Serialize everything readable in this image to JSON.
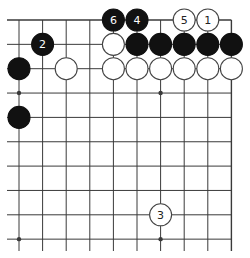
{
  "diagram": {
    "type": "go-board-fragment",
    "columns": 10,
    "rows": 10,
    "edges": [
      "top",
      "right"
    ],
    "grid_origin": {
      "x": 19,
      "y": 20
    },
    "spacing": {
      "x": 23.6,
      "y": 24.35
    },
    "stone_radius": 11,
    "line_color": "#3a3a3a",
    "black_color": "#111111",
    "white_fill": "#ffffff",
    "star_points": [
      [
        0,
        3
      ],
      [
        6,
        3
      ],
      [
        0,
        9
      ],
      [
        6,
        9
      ]
    ],
    "stones": [
      {
        "col": 4,
        "row": 0,
        "color": "black",
        "label": "6"
      },
      {
        "col": 5,
        "row": 0,
        "color": "black",
        "label": "4"
      },
      {
        "col": 7,
        "row": 0,
        "color": "white",
        "label": "5"
      },
      {
        "col": 8,
        "row": 0,
        "color": "white",
        "label": "1"
      },
      {
        "col": 1,
        "row": 1,
        "color": "black",
        "label": "2"
      },
      {
        "col": 4,
        "row": 1,
        "color": "white",
        "label": ""
      },
      {
        "col": 5,
        "row": 1,
        "color": "black",
        "label": ""
      },
      {
        "col": 6,
        "row": 1,
        "color": "black",
        "label": ""
      },
      {
        "col": 7,
        "row": 1,
        "color": "black",
        "label": ""
      },
      {
        "col": 8,
        "row": 1,
        "color": "black",
        "label": ""
      },
      {
        "col": 9,
        "row": 1,
        "color": "black",
        "label": ""
      },
      {
        "col": 0,
        "row": 2,
        "color": "black",
        "label": ""
      },
      {
        "col": 2,
        "row": 2,
        "color": "white",
        "label": ""
      },
      {
        "col": 4,
        "row": 2,
        "color": "white",
        "label": ""
      },
      {
        "col": 5,
        "row": 2,
        "color": "white",
        "label": ""
      },
      {
        "col": 6,
        "row": 2,
        "color": "white",
        "label": ""
      },
      {
        "col": 7,
        "row": 2,
        "color": "white",
        "label": ""
      },
      {
        "col": 8,
        "row": 2,
        "color": "white",
        "label": ""
      },
      {
        "col": 9,
        "row": 2,
        "color": "white",
        "label": ""
      },
      {
        "col": 0,
        "row": 4,
        "color": "black",
        "label": ""
      },
      {
        "col": 6,
        "row": 8,
        "color": "white",
        "label": "3"
      }
    ]
  }
}
